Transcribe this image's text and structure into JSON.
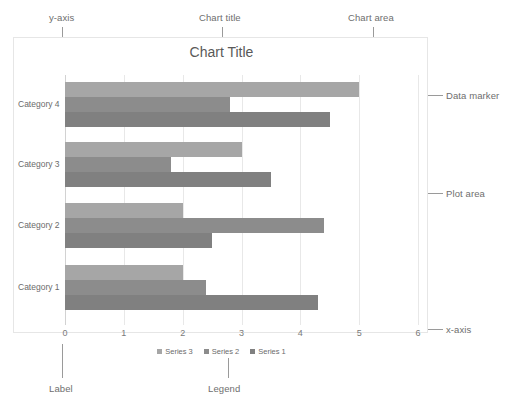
{
  "chart_data": {
    "type": "bar",
    "orientation": "horizontal",
    "title": "Chart Title",
    "xlabel": "",
    "ylabel": "",
    "categories": [
      "Category 1",
      "Category 2",
      "Category 3",
      "Category 4"
    ],
    "series": [
      {
        "name": "Series 1",
        "color": "#808080",
        "values": [
          4.3,
          2.5,
          3.5,
          4.5
        ]
      },
      {
        "name": "Series 2",
        "color": "#8c8c8c",
        "values": [
          2.4,
          4.4,
          1.8,
          2.8
        ]
      },
      {
        "name": "Series 3",
        "color": "#a6a6a6",
        "values": [
          2.0,
          2.0,
          3.0,
          5.0
        ]
      }
    ],
    "xlim": [
      0,
      6
    ],
    "xticks": [
      "0",
      "1",
      "2",
      "3",
      "4",
      "5",
      "6"
    ],
    "grid": true,
    "legend_position": "bottom",
    "legend_order": [
      "Series 3",
      "Series 2",
      "Series 1"
    ]
  },
  "annotations": {
    "y_axis": "y-axis",
    "chart_title": "Chart title",
    "chart_area": "Chart area",
    "data_marker": "Data marker",
    "plot_area": "Plot area",
    "x_axis": "x-axis",
    "label": "Label",
    "legend": "Legend"
  },
  "colors": {
    "chart_area_border": "#e6e6e6",
    "gridline": "#e8e8e8",
    "leader_line": "#9a9a9a",
    "annotation_text": "#6e6e6e",
    "title_text": "#595959",
    "tick_text": "#7a7a7a"
  }
}
